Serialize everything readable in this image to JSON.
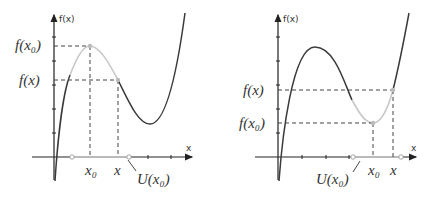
{
  "panels": [
    {
      "id": "left",
      "y_axis_label": "f(x)",
      "x_axis_label": "x",
      "fx0_label": "f(x₀)",
      "fx_label": "f(x)",
      "x0_label": "x₀",
      "x_label": "x",
      "neighborhood_label": "U(x₀)",
      "description": "Local maximum at x0: f(x) < f(x0) within neighborhood U(x0)"
    },
    {
      "id": "right",
      "y_axis_label": "f(x)",
      "x_axis_label": "x",
      "fx_label": "f(x)",
      "fx0_label": "f(x₀)",
      "x0_label": "x₀",
      "x_label": "x",
      "neighborhood_label": "U(x₀)",
      "description": "Local minimum at x0: f(x) > f(x0) within neighborhood U(x0)"
    }
  ],
  "colors": {
    "curve": "#3a3a3a",
    "highlight": "#c8c8c8",
    "axis": "#222222",
    "dash": "#444444"
  }
}
